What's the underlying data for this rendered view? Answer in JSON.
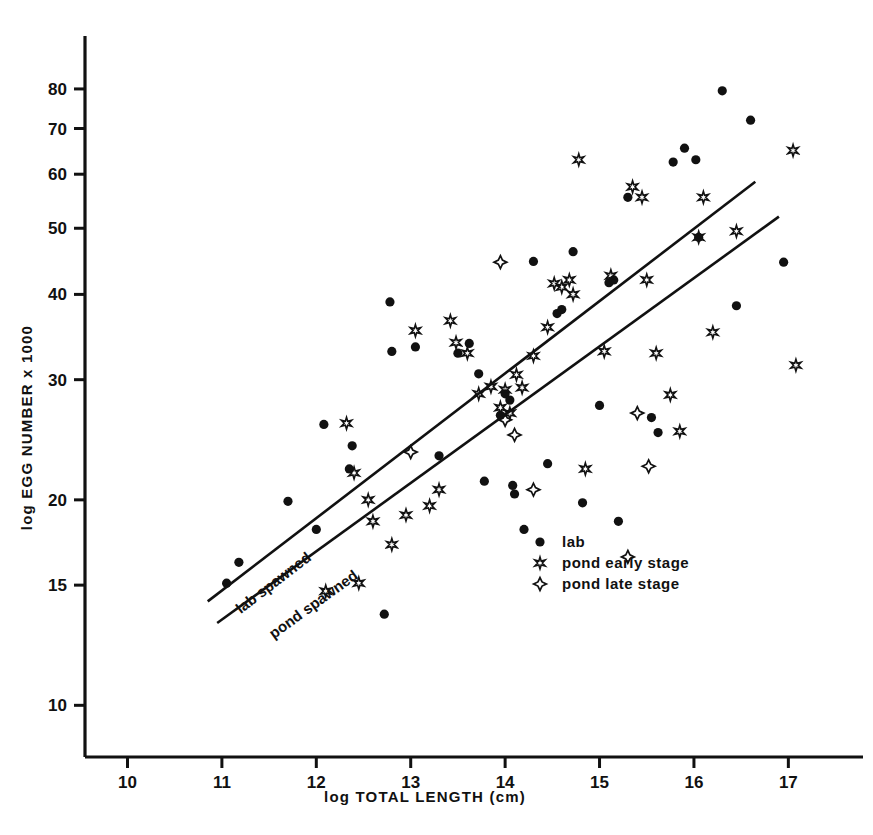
{
  "chart_data": {
    "type": "scatter",
    "title": "",
    "xlabel": "log  TOTAL  LENGTH (cm)",
    "ylabel": "log  EGG  NUMBER  x 1000",
    "xlim": [
      9.55,
      17.6
    ],
    "ylim": [
      8.4,
      95
    ],
    "yscale": "log",
    "xscale": "linear",
    "grid": false,
    "legend_position": "center-bottom",
    "xticks": [
      10,
      11,
      12,
      13,
      14,
      15,
      16,
      17
    ],
    "xtick_labels": [
      "10",
      "11",
      "12",
      "13",
      "14",
      "15",
      "16",
      "17"
    ],
    "yticks": [
      10,
      15,
      20,
      30,
      40,
      50,
      60,
      70,
      80
    ],
    "ytick_labels": [
      "10",
      "15",
      "20",
      "30",
      "40",
      "50",
      "60",
      "70",
      "80"
    ],
    "series": [
      {
        "name": "lab",
        "marker": "filled-circle",
        "color": "#000000",
        "points": [
          [
            11.05,
            15.1
          ],
          [
            11.18,
            16.2
          ],
          [
            11.7,
            19.9
          ],
          [
            12.0,
            18.1
          ],
          [
            12.08,
            25.8
          ],
          [
            12.35,
            22.2
          ],
          [
            12.38,
            24.0
          ],
          [
            12.72,
            13.6
          ],
          [
            12.78,
            39.0
          ],
          [
            12.8,
            33.0
          ],
          [
            13.05,
            33.5
          ],
          [
            13.3,
            23.2
          ],
          [
            13.5,
            32.8
          ],
          [
            13.62,
            33.9
          ],
          [
            13.72,
            30.6
          ],
          [
            13.78,
            21.3
          ],
          [
            13.95,
            26.6
          ],
          [
            14.0,
            28.6
          ],
          [
            14.05,
            28.0
          ],
          [
            14.08,
            21.0
          ],
          [
            14.1,
            20.4
          ],
          [
            14.2,
            18.1
          ],
          [
            14.3,
            44.7
          ],
          [
            14.45,
            22.6
          ],
          [
            14.55,
            37.5
          ],
          [
            14.6,
            38.0
          ],
          [
            14.72,
            46.2
          ],
          [
            14.82,
            19.8
          ],
          [
            15.0,
            27.5
          ],
          [
            15.1,
            41.6
          ],
          [
            15.15,
            42.0
          ],
          [
            15.2,
            18.6
          ],
          [
            15.3,
            55.5
          ],
          [
            15.55,
            26.4
          ],
          [
            15.62,
            25.1
          ],
          [
            15.78,
            62.5
          ],
          [
            15.9,
            65.5
          ],
          [
            16.02,
            63.0
          ],
          [
            16.05,
            48.5
          ],
          [
            16.3,
            79.5
          ],
          [
            16.45,
            38.5
          ],
          [
            16.6,
            72.0
          ],
          [
            16.95,
            44.6
          ]
        ]
      },
      {
        "name": "pond early stage",
        "marker": "open-six-star",
        "color": "#000000",
        "points": [
          [
            12.1,
            14.7
          ],
          [
            12.32,
            25.9
          ],
          [
            12.4,
            21.9
          ],
          [
            12.45,
            15.1
          ],
          [
            12.55,
            20.0
          ],
          [
            12.6,
            18.6
          ],
          [
            12.8,
            17.2
          ],
          [
            12.95,
            19.0
          ],
          [
            13.05,
            35.4
          ],
          [
            13.2,
            19.6
          ],
          [
            13.3,
            20.7
          ],
          [
            13.42,
            36.6
          ],
          [
            13.48,
            34.0
          ],
          [
            13.6,
            32.8
          ],
          [
            13.72,
            28.6
          ],
          [
            13.85,
            29.3
          ],
          [
            13.95,
            27.3
          ],
          [
            14.0,
            29.0
          ],
          [
            14.05,
            26.8
          ],
          [
            14.12,
            30.5
          ],
          [
            14.18,
            29.2
          ],
          [
            14.3,
            32.5
          ],
          [
            14.45,
            35.8
          ],
          [
            14.52,
            41.5
          ],
          [
            14.6,
            41.0
          ],
          [
            14.68,
            42.0
          ],
          [
            14.72,
            40.0
          ],
          [
            14.78,
            63.0
          ],
          [
            14.85,
            22.2
          ],
          [
            15.05,
            33.0
          ],
          [
            15.12,
            42.6
          ],
          [
            15.35,
            57.5
          ],
          [
            15.45,
            55.5
          ],
          [
            15.5,
            42.0
          ],
          [
            15.6,
            32.8
          ],
          [
            15.75,
            28.5
          ],
          [
            15.85,
            25.2
          ],
          [
            16.05,
            48.5
          ],
          [
            16.1,
            55.5
          ],
          [
            16.2,
            35.2
          ],
          [
            16.45,
            49.5
          ],
          [
            17.05,
            65.0
          ],
          [
            17.08,
            31.5
          ]
        ]
      },
      {
        "name": "pond late stage",
        "marker": "open-four-star",
        "color": "#000000",
        "points": [
          [
            13.0,
            23.5
          ],
          [
            13.95,
            44.6
          ],
          [
            14.0,
            26.2
          ],
          [
            14.1,
            24.9
          ],
          [
            14.3,
            20.7
          ],
          [
            15.3,
            16.5
          ],
          [
            15.4,
            26.8
          ],
          [
            15.52,
            22.4
          ]
        ]
      }
    ],
    "fit_lines": [
      {
        "label": "lab spawned",
        "x0": 10.85,
        "y0": 14.2,
        "x1": 16.65,
        "y1": 58.5,
        "label_x": 11.2,
        "label_y": 13.6
      },
      {
        "label": "pond spawned",
        "x0": 10.95,
        "y0": 13.2,
        "x1": 16.9,
        "y1": 52.0,
        "label_x": 11.55,
        "label_y": 12.5
      }
    ]
  },
  "legend": {
    "items": [
      {
        "label": "lab",
        "marker": "filled-circle"
      },
      {
        "label": "pond early stage",
        "marker": "open-six-star"
      },
      {
        "label": "pond late stage",
        "marker": "open-four-star"
      }
    ]
  }
}
